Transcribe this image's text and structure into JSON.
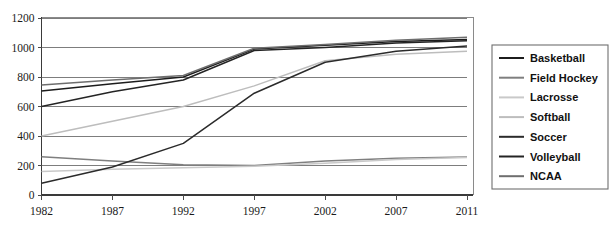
{
  "chart_data": {
    "type": "line",
    "title": "",
    "subtitle": "",
    "xlabel": "",
    "ylabel": "",
    "x": [
      "1982",
      "1987",
      "1992",
      "1997",
      "2002",
      "2007",
      "2011"
    ],
    "xlim": [
      1982,
      2011
    ],
    "ylim": [
      0,
      1200
    ],
    "yticks": [
      "0",
      "200",
      "400",
      "600",
      "800",
      "1000",
      "1200"
    ],
    "ytick_values": [
      0,
      200,
      400,
      600,
      800,
      1000,
      1200
    ],
    "grid": "horizontal",
    "legend_position": "right",
    "series": [
      {
        "name": "Basketball",
        "color": "#1c1c1c",
        "values": [
          705,
          755,
          800,
          990,
          1015,
          1040,
          1055
        ]
      },
      {
        "name": "Field Hockey",
        "color": "#7f7f7f",
        "values": [
          260,
          230,
          205,
          200,
          230,
          250,
          258
        ]
      },
      {
        "name": "Lacrosse",
        "color": "#c9c9c9",
        "values": [
          160,
          175,
          185,
          195,
          215,
          240,
          255
        ]
      },
      {
        "name": "Softball",
        "color": "#bdbdbd",
        "values": [
          400,
          500,
          600,
          740,
          910,
          955,
          975
        ]
      },
      {
        "name": "Soccer",
        "color": "#2b2b2b",
        "values": [
          80,
          190,
          350,
          690,
          900,
          975,
          1010
        ]
      },
      {
        "name": "Volleyball",
        "color": "#242424",
        "values": [
          600,
          700,
          780,
          980,
          1000,
          1030,
          1045
        ]
      },
      {
        "name": "NCAA",
        "color": "#6e6e6e",
        "values": [
          745,
          780,
          810,
          995,
          1020,
          1050,
          1070
        ]
      }
    ]
  },
  "legend": {
    "entries": [
      {
        "label": "Basketball"
      },
      {
        "label": "Field Hockey"
      },
      {
        "label": "Lacrosse"
      },
      {
        "label": "Softball"
      },
      {
        "label": "Soccer"
      },
      {
        "label": "Volleyball"
      },
      {
        "label": "NCAA"
      }
    ]
  },
  "axes": {
    "y_tick_labels": [
      "1200",
      "1000",
      "800",
      "600",
      "400",
      "200",
      "0"
    ],
    "x_tick_labels": [
      "1982",
      "1987",
      "1992",
      "1997",
      "2002",
      "2007",
      "2011"
    ]
  }
}
